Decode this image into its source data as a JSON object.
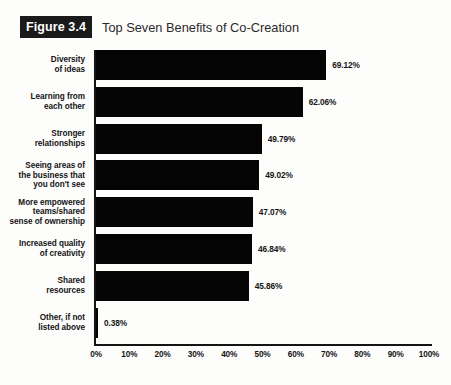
{
  "figure": {
    "badge": "Figure 3.4",
    "title": "Top Seven Benefits of Co-Creation"
  },
  "chart_data": {
    "type": "bar",
    "orientation": "horizontal",
    "title": "Top Seven Benefits of Co-Creation",
    "xlabel": "",
    "ylabel": "",
    "xlim": [
      0,
      100
    ],
    "xticks": [
      "0%",
      "10%",
      "20%",
      "30%",
      "40%",
      "50%",
      "60%",
      "70%",
      "80%",
      "90%",
      "100%"
    ],
    "xtick_values": [
      0,
      10,
      20,
      30,
      40,
      50,
      60,
      70,
      80,
      90,
      100
    ],
    "grid": false,
    "legend": null,
    "bar_color": "#050505",
    "categories": [
      "Diversity of ideas",
      "Learning from each other",
      "Stronger relationships",
      "Seeing areas of the business that you don't see",
      "More empowered teams/shared sense of ownership",
      "Increased quality of creativity",
      "Shared resources",
      "Other, if not listed above"
    ],
    "values": [
      69.12,
      62.06,
      49.79,
      49.02,
      47.07,
      46.84,
      45.86,
      0.38
    ],
    "value_labels": [
      "69.12%",
      "62.06%",
      "49.79%",
      "49.02%",
      "47.07%",
      "46.84%",
      "45.86%",
      "0.38%"
    ],
    "category_lines": [
      [
        "Diversity",
        "of ideas"
      ],
      [
        "Learning from",
        "each other"
      ],
      [
        "Stronger",
        "relationships"
      ],
      [
        "Seeing areas of",
        "the business that",
        "you don't see"
      ],
      [
        "More empowered",
        "teams/shared",
        "sense of ownership"
      ],
      [
        "Increased quality",
        "of creativity"
      ],
      [
        "Shared",
        "resources"
      ],
      [
        "Other, if not",
        "listed above"
      ]
    ]
  }
}
